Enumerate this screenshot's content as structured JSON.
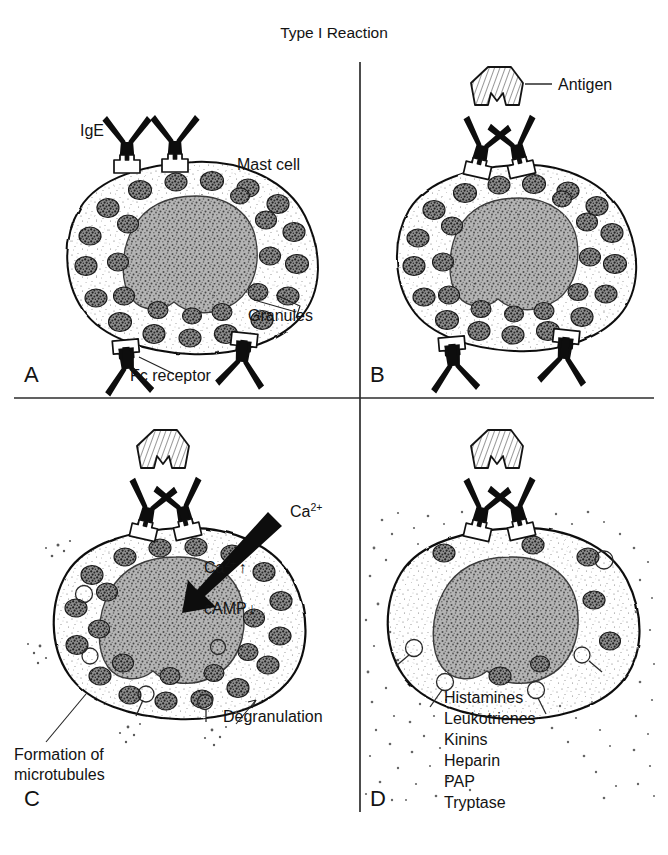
{
  "figure": {
    "title": "Type I Reaction",
    "background_color": "#ffffff",
    "ink_color": "#131313",
    "width": 668,
    "height": 855
  },
  "panels": {
    "a": {
      "letter": "A",
      "labels": {
        "ige": "IgE",
        "mast_cell": "Mast cell",
        "granules": "Granules",
        "fc_receptor": "Fc receptor"
      }
    },
    "b": {
      "letter": "B",
      "labels": {
        "antigen": "Antigen"
      }
    },
    "c": {
      "letter": "C",
      "labels": {
        "calcium_influx": "Ca",
        "calcium_influx_sup": "2+",
        "calcium_rise": "Ca",
        "calcium_rise_sup": "2+",
        "calcium_rise_arrow": "↑",
        "camp": "cAMP",
        "camp_arrow": "↓",
        "formation_line1": "Formation of",
        "formation_line2": "microtubules",
        "degranulation": "Degranulation"
      }
    },
    "d": {
      "letter": "D",
      "mediators": [
        "Histamines",
        "Leukotrienes",
        "Kinins",
        "Heparin",
        "PAP",
        "Tryptase"
      ]
    }
  }
}
